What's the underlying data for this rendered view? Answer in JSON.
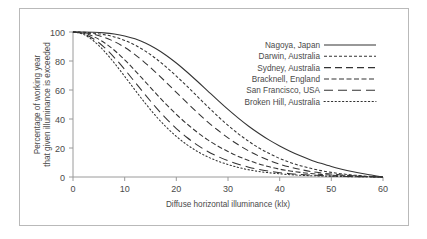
{
  "chart_data": {
    "type": "line",
    "title": "",
    "subtitle": "",
    "xlabel": "Diffuse horizontal illuminance (klx)",
    "ylabel_line1": "Percentage of working year",
    "ylabel_line2": "that given illuminance is exceeded",
    "xlim": [
      0,
      60
    ],
    "ylim": [
      0,
      100
    ],
    "xticks": [
      0,
      10,
      20,
      30,
      40,
      50,
      60
    ],
    "yticks": [
      0,
      20,
      40,
      60,
      80,
      100
    ],
    "xtick_labels": [
      "0",
      "10",
      "20",
      "30",
      "40",
      "50",
      "60"
    ],
    "ytick_labels": [
      "0",
      "20",
      "40",
      "60",
      "80",
      "100"
    ],
    "grid": false,
    "legend_position": "top-right-inside",
    "x": [
      0,
      2,
      4,
      6,
      8,
      10,
      12,
      14,
      16,
      18,
      20,
      22,
      24,
      26,
      28,
      30,
      32,
      34,
      36,
      38,
      40,
      42,
      44,
      46,
      48,
      50,
      52,
      54,
      56,
      58,
      60
    ],
    "series": [
      {
        "name": "Nagoya, Japan",
        "dash": "solid",
        "values": [
          100,
          100,
          99.8,
          99.4,
          98.6,
          97.3,
          95.3,
          92.4,
          88.6,
          84.0,
          78.6,
          72.6,
          66.2,
          59.6,
          53.0,
          46.6,
          40.6,
          35.0,
          30.0,
          25.4,
          21.4,
          17.8,
          14.6,
          11.8,
          9.4,
          7.2,
          5.4,
          3.8,
          2.4,
          1.2,
          0
        ]
      },
      {
        "name": "Darwin, Australia",
        "dash": "short-dash",
        "values": [
          100,
          99.8,
          99.2,
          98.2,
          96.6,
          94.2,
          91.0,
          86.8,
          81.8,
          76.0,
          69.6,
          62.8,
          55.8,
          48.8,
          42.0,
          35.6,
          29.8,
          24.6,
          20.0,
          16.2,
          12.8,
          10.0,
          7.8,
          6.0,
          4.4,
          3.2,
          2.2,
          1.4,
          0.8,
          0.3,
          0
        ]
      },
      {
        "name": "Sydney, Australia",
        "dash": "long-dash",
        "values": [
          100,
          99.6,
          98.4,
          96.4,
          93.4,
          89.4,
          84.4,
          78.6,
          72.2,
          65.4,
          58.4,
          51.4,
          44.6,
          38.2,
          32.4,
          27.0,
          22.2,
          18.0,
          14.4,
          11.4,
          8.8,
          6.8,
          5.2,
          3.8,
          2.8,
          2.0,
          1.4,
          0.9,
          0.5,
          0.2,
          0
        ]
      },
      {
        "name": "Bracknell, England",
        "dash": "medium-dash",
        "values": [
          100,
          99.2,
          96.8,
          92.8,
          87.4,
          80.8,
          73.4,
          65.6,
          57.8,
          50.2,
          43.2,
          36.8,
          31.0,
          25.8,
          21.4,
          17.6,
          14.2,
          11.4,
          9.0,
          7.0,
          5.4,
          4.2,
          3.2,
          2.4,
          1.8,
          1.3,
          0.9,
          0.6,
          0.4,
          0.2,
          0
        ]
      },
      {
        "name": "San Francisco, USA",
        "dash": "extra-long-dash",
        "values": [
          100,
          98.8,
          95.2,
          89.6,
          82.4,
          74.2,
          65.4,
          56.6,
          48.2,
          40.4,
          33.4,
          27.4,
          22.2,
          17.8,
          14.2,
          11.2,
          8.8,
          6.8,
          5.2,
          4.0,
          3.0,
          2.3,
          1.7,
          1.3,
          1.0,
          0.7,
          0.5,
          0.3,
          0.2,
          0.1,
          0
        ]
      },
      {
        "name": "Broken Hill, Australia",
        "dash": "dotted",
        "values": [
          100,
          98.4,
          93.8,
          87.0,
          78.6,
          69.4,
          60.0,
          50.8,
          42.2,
          34.6,
          28.0,
          22.4,
          17.8,
          14.0,
          11.0,
          8.6,
          6.6,
          5.0,
          3.8,
          2.9,
          2.2,
          1.6,
          1.2,
          0.9,
          0.7,
          0.5,
          0.35,
          0.22,
          0.13,
          0.06,
          0
        ]
      }
    ]
  },
  "legend": {
    "entries": [
      {
        "label": "Nagoya, Japan"
      },
      {
        "label": "Darwin, Australia"
      },
      {
        "label": "Sydney, Australia"
      },
      {
        "label": "Bracknell, England"
      },
      {
        "label": "San Francisco, USA"
      },
      {
        "label": "Broken Hill, Australia"
      }
    ]
  },
  "colors": {
    "curve": "#333333",
    "axis": "#9a9a9a",
    "text": "#4a4a4a",
    "frame": "#b9b9b9",
    "background": "#ffffff"
  }
}
